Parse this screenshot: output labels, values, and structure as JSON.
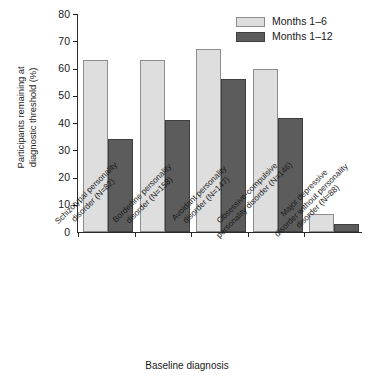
{
  "chart_data": {
    "type": "bar",
    "title": "",
    "xlabel": "Baseline diagnosis",
    "ylabel": "Participants remaining at\ndiagnostic threshold (%)",
    "ylim": [
      0,
      80
    ],
    "yticks": [
      0,
      10,
      20,
      30,
      40,
      50,
      60,
      70,
      80
    ],
    "ytick_labels": [
      "0",
      "10",
      "20",
      "30",
      "40",
      "50",
      "60",
      "70",
      "80"
    ],
    "grid": false,
    "legend_position": "top-right",
    "categories": [
      "Schizotypal personality\ndisorder (N=82)",
      "Borderline personality\ndisorder (N=158)",
      "Avoidant personality\ndisorder (N=147)",
      "Obsessive-compulsive\npersonality disorder (N=146)",
      "Major depressive\ndisorder without personality\ndisorder (N=88)"
    ],
    "series": [
      {
        "name": "Months 1–6",
        "color": "#dedede",
        "values": [
          63,
          63,
          67,
          60,
          6.5
        ]
      },
      {
        "name": "Months 1–12",
        "color": "#5c5c5c",
        "values": [
          34,
          41,
          56,
          42,
          3
        ]
      }
    ]
  },
  "legend": {
    "items": [
      {
        "label": "Months 1–6",
        "swatch": "light"
      },
      {
        "label": "Months 1–12",
        "swatch": "dark"
      }
    ]
  },
  "axes": {
    "y_title": "Participants remaining at\ndiagnostic threshold (%)",
    "x_title": "Baseline diagnosis"
  }
}
